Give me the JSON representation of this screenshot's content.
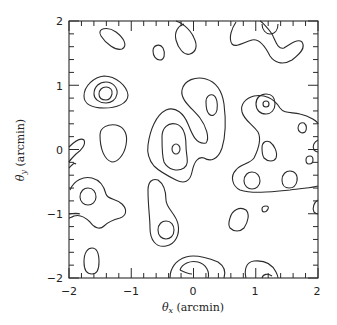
{
  "chart_data": {
    "type": "contour",
    "title": "",
    "xlabel": "θx (arcmin)",
    "ylabel": "θy (arcmin)",
    "xlim": [
      -2,
      2
    ],
    "ylim": [
      -2,
      2
    ],
    "x_ticks": [
      "-2",
      "-1",
      "0",
      "1",
      "2"
    ],
    "y_ticks": [
      "-2",
      "-1",
      "0",
      "1",
      "2"
    ],
    "minor_tick_step": 0.2,
    "grid": false,
    "legend": null,
    "features": [
      {
        "name": "peak-upper-left",
        "center": [
          -1.45,
          0.85
        ],
        "levels": 3
      },
      {
        "name": "blob-top-left",
        "center": [
          -1.2,
          1.7
        ],
        "levels": 1
      },
      {
        "name": "blob-left-mid",
        "center": [
          -1.2,
          0.05
        ],
        "levels": 1
      },
      {
        "name": "elongated-center",
        "center": [
          -0.3,
          0.3
        ],
        "levels": 3
      },
      {
        "name": "peak-right-upper",
        "center": [
          1.1,
          0.55
        ],
        "levels": 3
      },
      {
        "name": "region-right-mid",
        "center": [
          1.2,
          -0.25
        ],
        "levels": 2
      },
      {
        "name": "blob-lower-left",
        "center": [
          -1.6,
          -0.75
        ],
        "levels": 2
      },
      {
        "name": "chain-lower-center",
        "center": [
          -0.5,
          -1.05
        ],
        "levels": 2
      },
      {
        "name": "peak-bottom-center",
        "center": [
          0.05,
          -1.85
        ],
        "levels": 3
      },
      {
        "name": "peak-bottom-right",
        "center": [
          1.15,
          -1.9
        ],
        "levels": 3
      },
      {
        "name": "blob-bottom-left",
        "center": [
          -1.6,
          -1.8
        ],
        "levels": 1
      },
      {
        "name": "blob-right-lower",
        "center": [
          0.6,
          -1.0
        ],
        "levels": 1
      }
    ]
  },
  "axes": {
    "x_label_main": "θ",
    "x_label_sub": "x",
    "x_label_unit": " (arcmin)",
    "y_label_main": "θ",
    "y_label_sub": "y",
    "y_label_unit": " (arcmin)",
    "x_tick_labels": [
      "−2",
      "−1",
      "0",
      "1",
      "2"
    ],
    "y_tick_labels": [
      "−2",
      "−1",
      "0",
      "1",
      "2"
    ]
  }
}
